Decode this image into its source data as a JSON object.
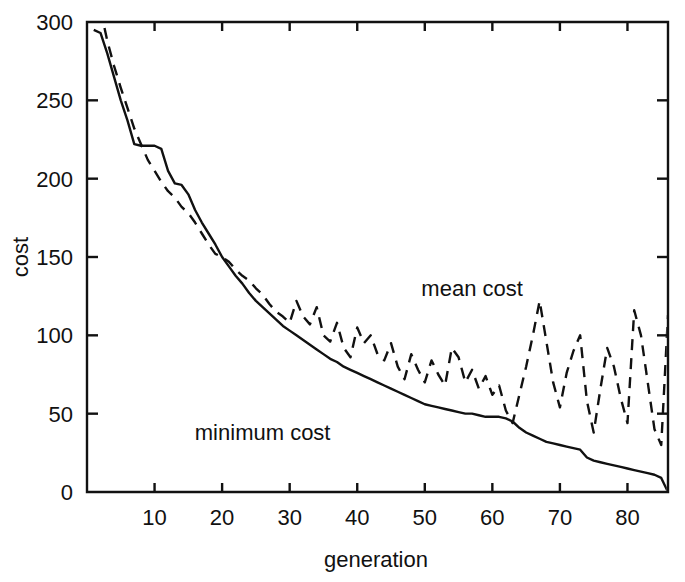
{
  "chart_data": {
    "type": "line",
    "title": "",
    "xlabel": "generation",
    "ylabel": "cost",
    "xlim": [
      0,
      86
    ],
    "ylim": [
      0,
      300
    ],
    "xticks": [
      10,
      20,
      30,
      40,
      50,
      60,
      70,
      80
    ],
    "yticks": [
      0,
      50,
      100,
      150,
      200,
      250,
      300
    ],
    "grid": false,
    "legend_position": "inline-annotations",
    "annotations": [
      {
        "text": "mean cost",
        "x": 57,
        "y": 125
      },
      {
        "text": "minimum cost",
        "x": 26,
        "y": 33
      }
    ],
    "series": [
      {
        "name": "minimum cost",
        "style": "solid",
        "color": "#111111",
        "x": [
          1,
          2,
          3,
          4,
          5,
          6,
          7,
          8,
          9,
          10,
          11,
          12,
          13,
          14,
          15,
          16,
          17,
          18,
          19,
          20,
          21,
          22,
          23,
          24,
          25,
          26,
          27,
          28,
          29,
          30,
          31,
          32,
          33,
          34,
          35,
          36,
          37,
          38,
          39,
          40,
          41,
          42,
          43,
          44,
          45,
          46,
          47,
          48,
          49,
          50,
          51,
          52,
          53,
          54,
          55,
          56,
          57,
          58,
          59,
          60,
          61,
          62,
          63,
          64,
          65,
          66,
          67,
          68,
          69,
          70,
          71,
          72,
          73,
          74,
          75,
          76,
          77,
          78,
          79,
          80,
          81,
          82,
          83,
          84,
          85,
          86
        ],
        "values": [
          295,
          293,
          280,
          265,
          250,
          237,
          222,
          221,
          221,
          221,
          219,
          205,
          197,
          196,
          190,
          180,
          172,
          165,
          158,
          150,
          144,
          138,
          133,
          127,
          122,
          118,
          114,
          110,
          106,
          103,
          100,
          97,
          94,
          91,
          88,
          85,
          83,
          80,
          78,
          76,
          74,
          72,
          70,
          68,
          66,
          64,
          62,
          60,
          58,
          56,
          55,
          54,
          53,
          52,
          51,
          50,
          50,
          49,
          48,
          48,
          48,
          47,
          45,
          41,
          38,
          36,
          34,
          32,
          31,
          30,
          29,
          28,
          27,
          22,
          20,
          19,
          18,
          17,
          16,
          15,
          14,
          13,
          12,
          11,
          9,
          0
        ]
      },
      {
        "name": "mean cost",
        "style": "dashed",
        "color": "#111111",
        "x": [
          2,
          3,
          4,
          5,
          6,
          7,
          8,
          9,
          10,
          11,
          12,
          13,
          14,
          15,
          16,
          17,
          18,
          19,
          20,
          21,
          22,
          23,
          24,
          25,
          26,
          27,
          28,
          29,
          30,
          31,
          32,
          33,
          34,
          35,
          36,
          37,
          38,
          39,
          40,
          41,
          42,
          43,
          44,
          45,
          46,
          47,
          48,
          49,
          50,
          51,
          52,
          53,
          54,
          55,
          56,
          57,
          58,
          59,
          60,
          61,
          62,
          63,
          64,
          65,
          66,
          67,
          68,
          69,
          70,
          71,
          72,
          73,
          74,
          75,
          76,
          77,
          78,
          79,
          80,
          81,
          82,
          83,
          84,
          85,
          86
        ],
        "values": [
          308,
          288,
          272,
          258,
          245,
          232,
          222,
          212,
          205,
          198,
          192,
          188,
          182,
          178,
          172,
          165,
          158,
          152,
          150,
          147,
          142,
          138,
          135,
          130,
          126,
          120,
          115,
          112,
          108,
          122,
          112,
          107,
          118,
          100,
          96,
          108,
          92,
          86,
          105,
          95,
          100,
          88,
          84,
          95,
          80,
          72,
          88,
          78,
          70,
          84,
          75,
          68,
          92,
          86,
          70,
          78,
          66,
          74,
          62,
          68,
          52,
          44,
          62,
          80,
          100,
          122,
          96,
          70,
          54,
          76,
          90,
          100,
          58,
          38,
          66,
          92,
          80,
          60,
          44,
          116,
          100,
          70,
          40,
          30,
          113
        ]
      }
    ]
  },
  "figure": {
    "axis_color": "#111111",
    "background": "#ffffff"
  }
}
